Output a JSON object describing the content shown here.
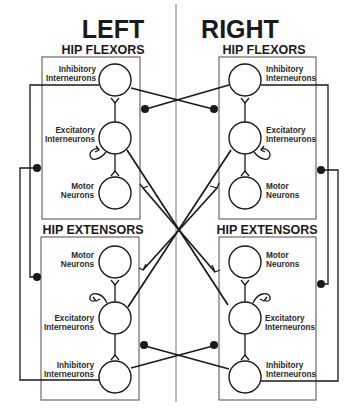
{
  "sides": {
    "left": {
      "title": "LEFT"
    },
    "right": {
      "title": "RIGHT"
    }
  },
  "groups": {
    "flexors": "HIP FLEXORS",
    "extensors": "HIP EXTENSORS"
  },
  "neurons": {
    "inhibitory": {
      "line1": "Inhibitory",
      "line2": "Interneurons"
    },
    "excitatory": {
      "line1": "Excitatory",
      "line2": "Interneurons"
    },
    "motor": {
      "line1": "Motor",
      "line2": "Neurons"
    }
  },
  "legend_semantics": {
    "fork_synapse": "excitatory-synapse",
    "filled_dot_synapse": "inhibitory-synapse"
  },
  "colors": {
    "ink": "#1a1a1a",
    "box": "#6a6a6a",
    "background": "#ffffff"
  }
}
